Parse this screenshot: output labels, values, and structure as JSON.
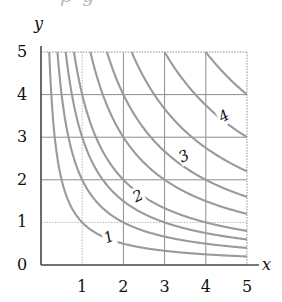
{
  "figure": {
    "partial_caption_above": "p g",
    "x_axis_label": "x",
    "y_axis_label": "y"
  },
  "axes": {
    "x_ticks": [
      "1",
      "2",
      "3",
      "4",
      "5"
    ],
    "y_ticks": [
      "0",
      "1",
      "2",
      "3",
      "4",
      "5"
    ]
  },
  "curve_labels": [
    {
      "text": "1",
      "x": 1.62,
      "y": 0.66,
      "rot": -22
    },
    {
      "text": "2",
      "x": 2.33,
      "y": 1.62,
      "rot": -26
    },
    {
      "text": "3",
      "x": 3.45,
      "y": 2.55,
      "rot": -28
    },
    {
      "text": "4",
      "x": 4.42,
      "y": 3.5,
      "rot": -30
    }
  ],
  "colors": {
    "curve": "#9a9a9a",
    "grid_major": "#8d8d8d",
    "grid_minor": "#b5b5b5",
    "axis": "#4a4a4a",
    "text": "#111111"
  },
  "chart_data": {
    "type": "line",
    "title": "",
    "xlabel": "x",
    "ylabel": "y",
    "xlim": [
      0,
      5.35
    ],
    "ylim": [
      0,
      5.35
    ],
    "xticks": [
      1,
      2,
      3,
      4,
      5
    ],
    "yticks": [
      0,
      1,
      2,
      3,
      4,
      5
    ],
    "grid": true,
    "grid_spacing": 1,
    "legend": "none",
    "family": "xy = c",
    "series": [
      {
        "name": "xy = 1",
        "c": 1,
        "label_shown": "1",
        "x": [
          0.2,
          0.25,
          0.3,
          0.4,
          0.5,
          0.65,
          0.8,
          1.0,
          1.25,
          1.5,
          2.0,
          2.5,
          3.0,
          3.5,
          4.0,
          4.5,
          5.0
        ],
        "y": [
          5.0,
          4.0,
          3.33,
          2.5,
          2.0,
          1.54,
          1.25,
          1.0,
          0.8,
          0.67,
          0.5,
          0.4,
          0.33,
          0.29,
          0.25,
          0.22,
          0.2
        ]
      },
      {
        "name": "xy = 2",
        "c": 2,
        "label_shown": "2",
        "x": [
          0.4,
          0.5,
          0.6,
          0.8,
          1.0,
          1.25,
          1.5,
          2.0,
          2.5,
          3.0,
          3.5,
          4.0,
          4.5,
          5.0
        ],
        "y": [
          5.0,
          4.0,
          3.33,
          2.5,
          2.0,
          1.6,
          1.33,
          1.0,
          0.8,
          0.67,
          0.57,
          0.5,
          0.44,
          0.4
        ]
      },
      {
        "name": "xy = 3",
        "c": 3,
        "label_shown": "3",
        "x": [
          0.6,
          0.75,
          1.0,
          1.25,
          1.5,
          2.0,
          2.5,
          3.0,
          3.5,
          4.0,
          4.5,
          5.0
        ],
        "y": [
          5.0,
          4.0,
          3.0,
          2.4,
          2.0,
          1.5,
          1.2,
          1.0,
          0.86,
          0.75,
          0.67,
          0.6
        ]
      },
      {
        "name": "xy = 4",
        "c": 4,
        "label_shown": "4",
        "x": [
          0.8,
          1.0,
          1.33,
          1.6,
          2.0,
          2.5,
          3.0,
          3.5,
          4.0,
          4.5,
          5.0
        ],
        "y": [
          5.0,
          4.0,
          3.0,
          2.5,
          2.0,
          1.6,
          1.33,
          1.14,
          1.0,
          0.89,
          0.8
        ]
      },
      {
        "name": "xy = 6",
        "c": 6,
        "label_shown": "",
        "x": [
          1.2,
          1.5,
          2.0,
          2.4,
          3.0,
          3.5,
          4.0,
          4.5,
          5.0
        ],
        "y": [
          5.0,
          4.0,
          3.0,
          2.5,
          2.0,
          1.71,
          1.5,
          1.33,
          1.2
        ]
      },
      {
        "name": "xy = 8",
        "c": 8,
        "label_shown": "",
        "x": [
          1.6,
          2.0,
          2.29,
          2.67,
          3.2,
          4.0,
          4.5,
          5.0
        ],
        "y": [
          5.0,
          4.0,
          3.5,
          3.0,
          2.5,
          2.0,
          1.78,
          1.6
        ]
      },
      {
        "name": "xy = 11",
        "c": 11,
        "label_shown": "",
        "x": [
          2.2,
          2.75,
          3.14,
          3.67,
          4.4,
          5.0
        ],
        "y": [
          5.0,
          4.0,
          3.5,
          3.0,
          2.5,
          2.2
        ]
      },
      {
        "name": "xy = 15",
        "c": 15,
        "label_shown": "",
        "x": [
          3.0,
          3.75,
          4.29,
          5.0
        ],
        "y": [
          5.0,
          4.0,
          3.5,
          3.0
        ]
      },
      {
        "name": "xy = 20",
        "c": 20,
        "label_shown": "",
        "x": [
          4.0,
          4.44,
          5.0
        ],
        "y": [
          5.0,
          4.5,
          4.0
        ]
      }
    ]
  }
}
